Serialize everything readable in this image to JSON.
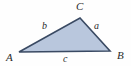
{
  "figure": {
    "type": "geometry-diagram",
    "shape": "triangle",
    "background_color": "#fefefe",
    "fill_color": "#b9c7dd",
    "stroke_color": "#3a4a63",
    "label_color": "#2b2b2b"
  },
  "vertices": [
    {
      "name": "A",
      "label": "A",
      "x": 19,
      "y": 52
    },
    {
      "name": "B",
      "label": "B",
      "x": 110,
      "y": 51
    },
    {
      "name": "C",
      "label": "C",
      "x": 80,
      "y": 18
    }
  ],
  "sides": [
    {
      "name": "a",
      "label": "a",
      "from": "B",
      "to": "C"
    },
    {
      "name": "b",
      "label": "b",
      "from": "A",
      "to": "C"
    },
    {
      "name": "c",
      "label": "c",
      "from": "A",
      "to": "B"
    }
  ]
}
